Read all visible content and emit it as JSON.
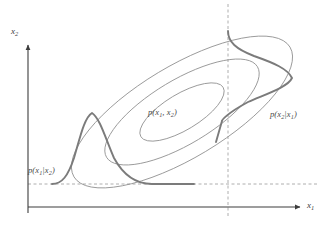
{
  "figure": {
    "background_color": "#ffffff"
  },
  "axes": {
    "x_axis": {
      "label_text": "x",
      "label_sub": "1",
      "name": "x1",
      "color": "#3d3d3d",
      "origin_x": 28,
      "y": 207,
      "end_x": 303,
      "arrow": "right"
    },
    "y_axis": {
      "label_text": "x",
      "label_sub": "2",
      "name": "x2",
      "color": "#3d3d3d",
      "x": 28,
      "origin_y": 207,
      "end_y": 42,
      "arrow": "up"
    }
  },
  "guides": {
    "color": "#9a9a9a",
    "dash": "3 2.5",
    "horizontal": {
      "name": "x2-conditioning-line",
      "y": 184,
      "x_start": 28,
      "x_end": 318
    },
    "vertical": {
      "name": "x1-conditioning-line",
      "x": 228,
      "y_start": 4,
      "y_end": 216
    }
  },
  "contours": {
    "name": "joint-density-contours",
    "color": "#8f8f8f",
    "stroke_width": 0.8,
    "center_x": 182,
    "center_y": 112,
    "rotation_deg": -31,
    "levels": [
      {
        "name": "contour-outer",
        "rx": 126,
        "ry": 46
      },
      {
        "name": "contour-middle",
        "rx": 88,
        "ry": 32
      },
      {
        "name": "contour-inner",
        "rx": 48,
        "ry": 18
      }
    ]
  },
  "curves": {
    "color": "#7b7b7b",
    "stroke_width": 1.9,
    "conditional_x1_given_x2": {
      "name": "p-x1-given-x2-curve",
      "baseline_y": 184,
      "peak_x": 92,
      "peak_y": 113,
      "x_start": 52,
      "x_end": 194,
      "orientation": "vertical-bell"
    },
    "conditional_x2_given_x1": {
      "name": "p-x2-given-x1-curve",
      "baseline_x": 228,
      "peak_x": 292,
      "peak_y": 78,
      "y_start": 31,
      "y_end": 121,
      "orientation": "horizontal-bell"
    }
  },
  "labels": {
    "joint": {
      "name": "joint-density-label",
      "prefix": "p(x",
      "sub1": "1",
      "mid": ", x",
      "sub2": "2",
      "suffix": ")"
    },
    "conditional_x1": {
      "name": "conditional-x1-label",
      "prefix": "p(x",
      "sub1": "1",
      "mid": "|x",
      "sub2": "2",
      "suffix": ")"
    },
    "conditional_x2": {
      "name": "conditional-x2-label",
      "prefix": "p(x",
      "sub1": "2",
      "mid": "|x",
      "sub2": "1",
      "suffix": ")"
    }
  }
}
